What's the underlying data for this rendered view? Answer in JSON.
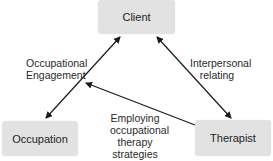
{
  "diagram": {
    "nodes": [
      {
        "id": "client",
        "label": "Client"
      },
      {
        "id": "occupation",
        "label": "Occupation"
      },
      {
        "id": "therapist",
        "label": "Therapist"
      }
    ],
    "edges": [
      {
        "from": "client",
        "to": "occupation",
        "direction": "bidirectional",
        "label_lines": [
          "Occupational",
          "Engagement"
        ]
      },
      {
        "from": "client",
        "to": "therapist",
        "direction": "bidirectional",
        "label_lines": [
          "Interpersonal",
          "relating"
        ]
      },
      {
        "from": "therapist",
        "to": "client-occupation-edge",
        "direction": "one-way",
        "label_lines": [
          "Employing",
          "occupational",
          "therapy",
          "strategies"
        ]
      }
    ],
    "colors": {
      "node_fill": "#e2e2e2",
      "edge": "#1a1a1a",
      "text": "#222222"
    }
  }
}
